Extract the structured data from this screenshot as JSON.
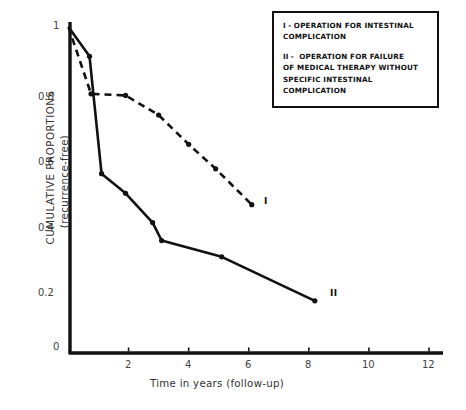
{
  "chart_data": {
    "type": "line",
    "title": "",
    "xlabel": "Time in years (follow-up)",
    "ylabel_line1": "CUMULATIVE PROPORTIONS",
    "ylabel_line2": "(recurrence-free)",
    "xlim": [
      0,
      12.5
    ],
    "ylim": [
      0,
      1.05
    ],
    "xticks": [
      "2",
      "4",
      "6",
      "8",
      "10",
      "12"
    ],
    "xtick_values": [
      2,
      4,
      6,
      8,
      10,
      12
    ],
    "yticks": [
      "0",
      "0.2",
      "0.4",
      "0.6",
      "0.8",
      "1"
    ],
    "ytick_values": [
      0,
      0.2,
      0.4,
      0.6,
      0.8,
      1
    ],
    "grid": false,
    "legend_position": "top-right",
    "series": [
      {
        "name": "I",
        "label": "OPERATION FOR INTESTINAL COMPLICATION",
        "style": "dashed",
        "marker": "filled-circle",
        "end_tag": "I",
        "x": [
          0,
          0.75,
          1.9,
          3.0,
          4.0,
          4.9,
          6.1
        ],
        "y": [
          1.0,
          0.795,
          0.79,
          0.73,
          0.64,
          0.565,
          0.455
        ]
      },
      {
        "name": "II",
        "label": "OPERATION FOR FAILURE OF MEDICAL THERAPY WITHOUT SPECIFIC INTESTINAL COMPLICATION",
        "style": "solid",
        "marker": "filled-circle",
        "end_tag": "II",
        "x": [
          0,
          0.7,
          1.1,
          1.9,
          2.8,
          3.1,
          5.1,
          8.2
        ],
        "y": [
          1.0,
          0.91,
          0.55,
          0.49,
          0.4,
          0.345,
          0.295,
          0.16
        ]
      }
    ]
  },
  "legend": {
    "entries": [
      {
        "symbol": "I -",
        "text": "OPERATION FOR INTESTINAL COMPLICATION"
      },
      {
        "symbol": "II -",
        "text": "OPERATION FOR FAILURE OF MEDICAL THERAPY WITHOUT SPECIFIC INTESTINAL COMPLICATION"
      }
    ],
    "entry1_line1": "OPERATION FOR INTESTINAL",
    "entry1_line2": "COMPLICATION",
    "entry2_line1": "OPERATION FOR FAILURE",
    "entry2_line2": "OF MEDICAL THERAPY WITHOUT",
    "entry2_line3": "SPECIFIC INTESTINAL",
    "entry2_line4": "COMPLICATION",
    "symbol1": "I -",
    "symbol2": "II -"
  },
  "axes": {
    "xtick_0": "2",
    "xtick_1": "4",
    "xtick_2": "6",
    "xtick_3": "8",
    "xtick_4": "10",
    "xtick_5": "12",
    "ytick_0": "0",
    "ytick_1": "0.2",
    "ytick_2": "0.4",
    "ytick_3": "0.6",
    "ytick_4": "0.8",
    "ytick_5": "1",
    "xtitle": "Time in years (follow-up)",
    "ytitle_line1": "CUMULATIVE PROPORTIONS",
    "ytitle_line2": "(recurrence-free)"
  },
  "annotations": {
    "curve1_tag": "I",
    "curve2_tag": "II"
  },
  "colors": {
    "ink": "#111111",
    "background": "#ffffff"
  }
}
